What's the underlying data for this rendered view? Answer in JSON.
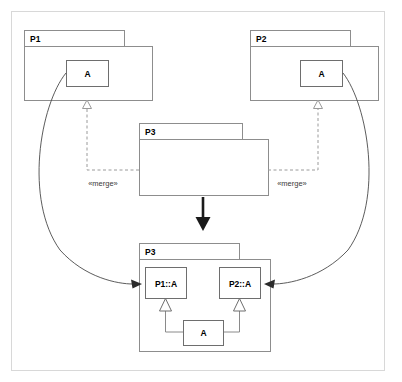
{
  "diagram": {
    "frame": {
      "x": 11,
      "y": 11,
      "width": 374,
      "height": 360
    },
    "colors": {
      "background": "#ffffff",
      "frame_stroke": "#d8d8d8",
      "package_stroke": "#8d8d8d",
      "class_stroke": "#6e6e6e",
      "merge_stroke": "#9a9a9a",
      "curve_stroke": "#4a4a4a",
      "bold_arrow": "#1a1a1a"
    },
    "packages": {
      "p1_source": {
        "name": "P1",
        "tab": {
          "x": 24,
          "y": 30,
          "width": 100,
          "height": 16
        },
        "body": {
          "x": 24,
          "y": 46,
          "width": 128,
          "height": 54
        },
        "classes": [
          {
            "name": "A",
            "x": 66,
            "y": 60,
            "width": 42,
            "height": 26
          }
        ]
      },
      "p2_source": {
        "name": "P2",
        "tab": {
          "x": 250,
          "y": 30,
          "width": 100,
          "height": 16
        },
        "body": {
          "x": 250,
          "y": 46,
          "width": 128,
          "height": 54
        },
        "classes": [
          {
            "name": "A",
            "x": 300,
            "y": 60,
            "width": 42,
            "height": 26
          }
        ]
      },
      "p3_before": {
        "name": "P3",
        "tab": {
          "x": 139,
          "y": 123,
          "width": 103,
          "height": 16
        },
        "body": {
          "x": 139,
          "y": 139,
          "width": 129,
          "height": 56
        },
        "classes": []
      },
      "p3_after": {
        "name": "P3",
        "tab": {
          "x": 139,
          "y": 243,
          "width": 100,
          "height": 16
        },
        "body": {
          "x": 139,
          "y": 259,
          "width": 131,
          "height": 92
        },
        "classes": [
          {
            "name": "P1::A",
            "x": 145,
            "y": 267,
            "width": 41,
            "height": 31
          },
          {
            "name": "P2::A",
            "x": 219,
            "y": 267,
            "width": 41,
            "height": 31
          },
          {
            "name": "A",
            "x": 183,
            "y": 320,
            "width": 40,
            "height": 25
          }
        ]
      }
    },
    "merge_relations": [
      {
        "label": "«merge»",
        "from": "P3",
        "to": "P1",
        "label_x": 103,
        "label_y": 184
      },
      {
        "label": "«merge»",
        "from": "P3",
        "to": "P2",
        "label_x": 292,
        "label_y": 184
      }
    ],
    "generalizations": [
      {
        "from": "A",
        "to": "P1::A"
      },
      {
        "from": "A",
        "to": "P2::A"
      }
    ],
    "transform_arrow": {
      "label": "",
      "from_x": 203,
      "from_y": 197,
      "to_x": 203,
      "to_y": 229
    },
    "trace_arrows": [
      {
        "from": "P1::A in P1",
        "to": "P1::A in merged P3"
      },
      {
        "from": "P2::A in P2",
        "to": "P2::A in merged P3"
      }
    ]
  }
}
